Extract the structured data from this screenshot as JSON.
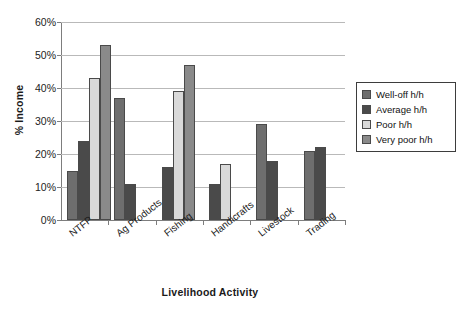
{
  "chart_data": {
    "type": "bar",
    "title": "",
    "xlabel": "Livelihood Activity",
    "ylabel": "% Income",
    "categories": [
      "NTFP",
      "Ag Products",
      "Fishing",
      "Handicrafts",
      "Livestock",
      "Trading"
    ],
    "series": [
      {
        "name": "Well-off h/h",
        "color": "#6e6e6e",
        "values": [
          15,
          37,
          null,
          null,
          29,
          21
        ]
      },
      {
        "name": "Average h/h",
        "color": "#4a4a4a",
        "values": [
          24,
          11,
          16,
          11,
          18,
          22
        ]
      },
      {
        "name": "Poor h/h",
        "color": "#d9d9d9",
        "values": [
          43,
          null,
          39,
          17,
          null,
          null
        ]
      },
      {
        "name": "Very poor h/h",
        "color": "#8a8a8a",
        "values": [
          53,
          null,
          47,
          null,
          null,
          null
        ]
      }
    ],
    "ylim": [
      0,
      60
    ],
    "ytick_step": 10,
    "yticks": [
      "0%",
      "10%",
      "20%",
      "30%",
      "40%",
      "50%",
      "60%"
    ],
    "grid": true,
    "legend_position": "right"
  },
  "legend": {
    "items": [
      {
        "label": "Well-off h/h"
      },
      {
        "label": "Average h/h"
      },
      {
        "label": "Poor h/h"
      },
      {
        "label": "Very poor h/h"
      }
    ]
  }
}
